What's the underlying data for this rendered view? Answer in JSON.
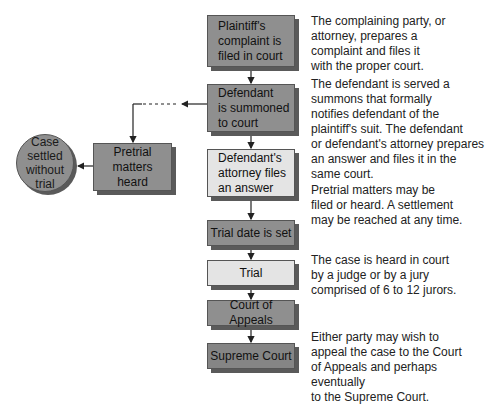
{
  "diagram": {
    "type": "flowchart",
    "colors": {
      "dark_box": "#8f8f8f",
      "light_box": "#e4e4e4",
      "shadow": "#5a5a5a",
      "line": "#333333"
    },
    "steps": [
      {
        "id": "complaint",
        "label": "Plaintiff's\ncomplaint is\nfiled in court"
      },
      {
        "id": "summoned",
        "label": "Defendant\nis summoned\nto court"
      },
      {
        "id": "answer",
        "label": "Defendant's\nattorney files\nan answer"
      },
      {
        "id": "trial_date",
        "label": "Trial date is set"
      },
      {
        "id": "trial",
        "label": "Trial"
      },
      {
        "id": "appeals",
        "label": "Court of Appeals"
      },
      {
        "id": "supreme",
        "label": "Supreme Court"
      }
    ],
    "branch": {
      "pretrial": {
        "label": "Pretrial\nmatters\nheard"
      },
      "settled": {
        "label": "Case\nsettled\nwithout\ntrial"
      }
    },
    "descriptions": [
      "The complaining party, or\nattorney, prepares a\ncomplaint and files it\nwith the proper court.",
      "The defendant is served a\nsummons that formally\nnotifies defendant of the\nplaintiff's suit. The defendant\nor defendant's attorney prepares\nan answer and files it in the\nsame court.",
      "Pretrial matters may be\nfiled or heard. A settlement\nmay be reached at any time.",
      "The case is heard in court\nby a judge or by a jury\ncomprised of 6 to 12 jurors.",
      "Either party may wish to\nappeal the case to the Court\nof Appeals and perhaps eventually\nto the Supreme Court."
    ]
  }
}
